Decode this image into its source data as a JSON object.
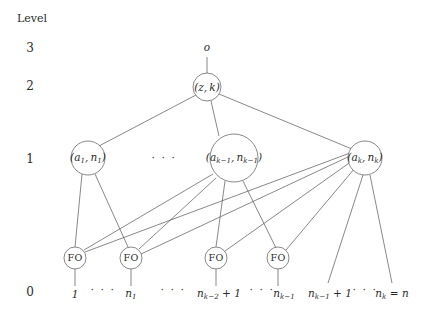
{
  "figure": {
    "type": "tree-diagram",
    "axis_title": "Level",
    "levels": [
      {
        "label": "3",
        "y": 48
      },
      {
        "label": "2",
        "y": 86
      },
      {
        "label": "1",
        "y": 159
      },
      {
        "label": "0",
        "y": 292
      }
    ],
    "root_label": "o",
    "nodes": {
      "level2": {
        "label_tex": "(z, k)",
        "name": "node-z-k"
      },
      "level1": [
        {
          "label_tex": "(a_1, n_1)",
          "name": "node-a1-n1"
        },
        {
          "label_tex": "(a_{k-1}, n_{k-1})",
          "name": "node-ak1-nk1"
        },
        {
          "label_tex": "(a_k, n_k)",
          "name": "node-ak-nk"
        }
      ],
      "level1_ellipsis": "· · ·",
      "fanout": [
        {
          "label": "FO",
          "name": "fo-node-1"
        },
        {
          "label": "FO",
          "name": "fo-node-2"
        },
        {
          "label": "FO",
          "name": "fo-node-3"
        },
        {
          "label": "FO",
          "name": "fo-node-4"
        }
      ]
    },
    "leaves": [
      {
        "tex": "1"
      },
      {
        "tex": "n_1"
      },
      {
        "tex": "n_{k-2} + 1"
      },
      {
        "tex": "n_{k-1}"
      },
      {
        "tex": "n_{k-1} + 1"
      },
      {
        "tex": "n_k = n"
      }
    ],
    "leaf_ellipses": [
      "· · ·",
      "· · ·",
      "· · ·",
      "· · ·"
    ],
    "colors": {
      "stroke": "#555555",
      "text": "#2b2b2b",
      "background": "#ffffff"
    }
  }
}
